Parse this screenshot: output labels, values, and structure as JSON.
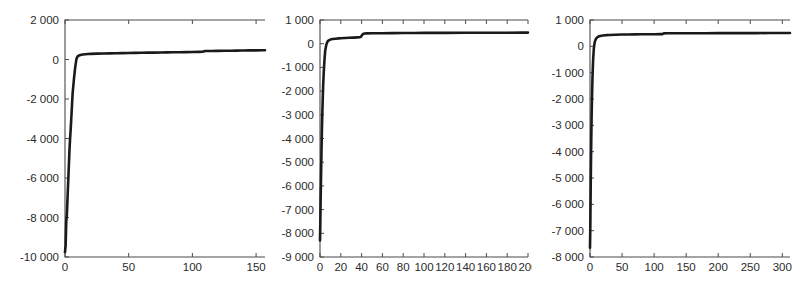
{
  "figure": {
    "background": "#ffffff",
    "line_color": "#1a1a1a",
    "axis_color": "#4a4a4a",
    "panel_count": 3
  },
  "chart_data": [
    {
      "type": "line",
      "title": "",
      "subtitle": "",
      "xlabel": "",
      "ylabel": "",
      "grid": false,
      "legend": null,
      "xlim": [
        0,
        157
      ],
      "ylim": [
        -10000,
        2000
      ],
      "xticks": [
        0,
        50,
        100,
        150
      ],
      "xticklabels": [
        "0",
        "50",
        "100",
        "150"
      ],
      "yticks": [
        2000,
        0,
        -2000,
        -4000,
        -6000,
        -8000,
        -10000
      ],
      "yticklabels": [
        "2 000",
        "0",
        "-2 000",
        "-4 000",
        "-6 000",
        "-8 000",
        "-10 000"
      ],
      "series": [
        {
          "name": "log-likelihood",
          "x": [
            0,
            0.5,
            1,
            1.5,
            2,
            2.5,
            3,
            3.5,
            4,
            4.5,
            5,
            5.5,
            6,
            7,
            8,
            9,
            10,
            12,
            14,
            16,
            18,
            20,
            25,
            30,
            35,
            40,
            45,
            50,
            55,
            60,
            65,
            70,
            75,
            80,
            85,
            90,
            95,
            100,
            105,
            108,
            110,
            115,
            120,
            125,
            130,
            135,
            138,
            140,
            145,
            150,
            155,
            157
          ],
          "y": [
            -9750,
            -9400,
            -8200,
            -7800,
            -7000,
            -6200,
            -5400,
            -4600,
            -4000,
            -3500,
            -2900,
            -2300,
            -1700,
            -1000,
            -400,
            30,
            170,
            230,
            255,
            268,
            278,
            285,
            297,
            305,
            312,
            318,
            324,
            330,
            336,
            341,
            346,
            350,
            355,
            360,
            365,
            370,
            375,
            380,
            386,
            390,
            428,
            432,
            436,
            440,
            444,
            448,
            452,
            455,
            460,
            463,
            467,
            470
          ]
        }
      ]
    },
    {
      "type": "line",
      "title": "",
      "subtitle": "",
      "xlabel": "",
      "ylabel": "",
      "grid": false,
      "legend": null,
      "xlim": [
        0,
        200
      ],
      "ylim": [
        -9000,
        1000
      ],
      "xticks": [
        0,
        20,
        40,
        60,
        80,
        100,
        120,
        140,
        160,
        180,
        200
      ],
      "xticklabels": [
        "0",
        "20",
        "40",
        "60",
        "80",
        "100",
        "120",
        "140",
        "160",
        "180",
        "200"
      ],
      "yticks": [
        1000,
        0,
        -1000,
        -2000,
        -3000,
        -4000,
        -5000,
        -6000,
        -7000,
        -8000,
        -9000
      ],
      "yticklabels": [
        "1 000",
        "0",
        "-1 000",
        "-2 000",
        "-3 000",
        "-4 000",
        "-5 000",
        "-6 000",
        "-7 000",
        "-8 000",
        "-9 000"
      ],
      "series": [
        {
          "name": "log-likelihood",
          "x": [
            0,
            0.3,
            0.6,
            1,
            1.4,
            1.8,
            2.2,
            2.6,
            3,
            3.5,
            4,
            4.5,
            5,
            6,
            7,
            8,
            10,
            12,
            15,
            18,
            20,
            24,
            28,
            32,
            36,
            38,
            39,
            40,
            41,
            42,
            43,
            45,
            50,
            60,
            70,
            80,
            90,
            100,
            120,
            140,
            160,
            180,
            195,
            200
          ],
          "y": [
            -8300,
            -7600,
            -6600,
            -5600,
            -4600,
            -3700,
            -3000,
            -2400,
            -1800,
            -1300,
            -900,
            -560,
            -300,
            -60,
            70,
            130,
            175,
            195,
            212,
            225,
            232,
            242,
            250,
            258,
            268,
            274,
            280,
            330,
            395,
            420,
            430,
            436,
            440,
            444,
            448,
            451,
            453,
            455,
            458,
            461,
            463,
            465,
            467,
            468
          ]
        }
      ]
    },
    {
      "type": "line",
      "title": "",
      "subtitle": "",
      "xlabel": "",
      "ylabel": "",
      "grid": false,
      "legend": null,
      "xlim": [
        0,
        312
      ],
      "ylim": [
        -8000,
        1000
      ],
      "xticks": [
        0,
        50,
        100,
        150,
        200,
        250,
        300
      ],
      "xticklabels": [
        "0",
        "50",
        "100",
        "150",
        "200",
        "250",
        "300"
      ],
      "yticks": [
        1000,
        0,
        -1000,
        -2000,
        -3000,
        -4000,
        -5000,
        -6000,
        -7000,
        -8000
      ],
      "yticklabels": [
        "1 000",
        "0",
        "-1 000",
        "-2 000",
        "-3 000",
        "-4 000",
        "-5 000",
        "-6 000",
        "-7 000",
        "-8 000"
      ],
      "series": [
        {
          "name": "log-likelihood",
          "x": [
            0,
            0.4,
            0.8,
            1.2,
            1.6,
            2,
            2.5,
            3,
            3.5,
            4,
            4.5,
            5,
            6,
            7,
            8,
            9,
            10,
            12,
            14,
            16,
            18,
            20,
            25,
            30,
            40,
            50,
            60,
            70,
            80,
            90,
            100,
            110,
            113,
            115,
            120,
            140,
            160,
            180,
            200,
            220,
            240,
            260,
            280,
            300,
            312
          ],
          "y": [
            -7650,
            -7000,
            -6100,
            -5100,
            -4250,
            -3500,
            -2700,
            -2100,
            -1550,
            -1100,
            -750,
            -450,
            -80,
            110,
            210,
            270,
            310,
            355,
            380,
            395,
            405,
            412,
            424,
            432,
            442,
            448,
            452,
            455,
            457,
            459,
            461,
            463,
            464,
            492,
            494,
            496,
            498,
            499,
            500,
            501,
            502,
            503,
            504,
            505,
            506
          ]
        }
      ]
    }
  ]
}
